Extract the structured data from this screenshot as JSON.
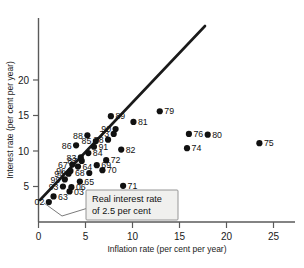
{
  "chart_data": {
    "type": "scatter",
    "title": "",
    "xlabel": "Inflation rate (per cent per year)",
    "ylabel": "Interest rate (per cent per year)",
    "xlim": [
      0,
      26
    ],
    "ylim": [
      0,
      23
    ],
    "xticks": [
      0,
      5,
      10,
      15,
      20,
      25
    ],
    "yticks": [
      5,
      10,
      15,
      20
    ],
    "grid": false,
    "legend_position": "inside-bottom-left",
    "annotations": [
      {
        "name": "real-interest-rate-note",
        "text_line1": "Real interest rate",
        "text_line2": "of 2.5 per cent",
        "points_to": "trend-line"
      }
    ],
    "reference_line": {
      "name": "real-interest-rate-2.5",
      "label": "Real interest rate of 2.5 per cent",
      "intercept": 2.5,
      "slope": 1.0
    },
    "point_label_key": "year",
    "points": [
      {
        "label": "89",
        "x": 7.7,
        "y": 14.9
      },
      {
        "label": "81",
        "x": 10.1,
        "y": 14.1
      },
      {
        "label": "79",
        "x": 12.9,
        "y": 15.6
      },
      {
        "label": "88",
        "x": 5.2,
        "y": 12.2
      },
      {
        "label": "90",
        "x": 8.2,
        "y": 13.1
      },
      {
        "label": "73",
        "x": 8.0,
        "y": 12.4
      },
      {
        "label": "76",
        "x": 16.0,
        "y": 12.4
      },
      {
        "label": "80",
        "x": 18.0,
        "y": 12.3
      },
      {
        "label": "86",
        "x": 4.0,
        "y": 10.8
      },
      {
        "label": "85",
        "x": 6.1,
        "y": 11.4
      },
      {
        "label": "78",
        "x": 7.4,
        "y": 11.6
      },
      {
        "label": "91",
        "x": 5.9,
        "y": 10.6
      },
      {
        "label": "82",
        "x": 8.8,
        "y": 10.2
      },
      {
        "label": "74",
        "x": 15.8,
        "y": 10.4
      },
      {
        "label": "75",
        "x": 23.5,
        "y": 11.1
      },
      {
        "label": "83",
        "x": 4.5,
        "y": 9.1
      },
      {
        "label": "84",
        "x": 5.3,
        "y": 9.7
      },
      {
        "label": "87",
        "x": 4.6,
        "y": 8.6
      },
      {
        "label": "72",
        "x": 7.2,
        "y": 8.7
      },
      {
        "label": "67",
        "x": 3.6,
        "y": 8.1
      },
      {
        "label": "64",
        "x": 4.2,
        "y": 7.8
      },
      {
        "label": "69",
        "x": 6.2,
        "y": 8.0
      },
      {
        "label": "70",
        "x": 6.8,
        "y": 7.3
      },
      {
        "label": "96",
        "x": 3.4,
        "y": 7.2
      },
      {
        "label": "94",
        "x": 3.2,
        "y": 6.8
      },
      {
        "label": "68",
        "x": 5.4,
        "y": 6.9
      },
      {
        "label": "99",
        "x": 2.8,
        "y": 6.0
      },
      {
        "label": "65",
        "x": 4.4,
        "y": 5.7
      },
      {
        "label": "93",
        "x": 2.6,
        "y": 5.0
      },
      {
        "label": "06",
        "x": 3.5,
        "y": 4.9
      },
      {
        "label": "03",
        "x": 3.3,
        "y": 4.3
      },
      {
        "label": "71",
        "x": 9.0,
        "y": 5.1
      },
      {
        "label": "63",
        "x": 1.6,
        "y": 3.6
      },
      {
        "label": "02",
        "x": 1.1,
        "y": 2.8
      }
    ]
  }
}
